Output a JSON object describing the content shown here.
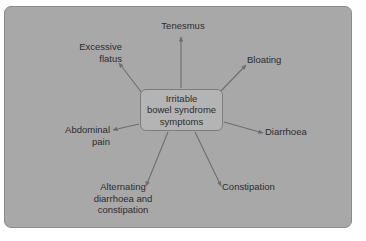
{
  "figure": {
    "type": "radial-concept-diagram",
    "panel_background_color": "#a8a8a8",
    "panel_border_color": "#8b8b8b",
    "page_background_color": "#ffffff",
    "text_color": "#2c2c2c",
    "arrow_color": "#6e6e6e",
    "center": {
      "label": "Irritable\nbowel syndrome\nsymptoms",
      "fill_color": "#b4b4b4",
      "border_color": "#7d7d7d"
    },
    "nodes": [
      {
        "id": "tenesmus",
        "label": "Tenesmus"
      },
      {
        "id": "bloating",
        "label": "Bloating"
      },
      {
        "id": "diarrhoea",
        "label": "Diarrhoea"
      },
      {
        "id": "constipation",
        "label": "Constipation"
      },
      {
        "id": "alternating",
        "label": "Alternating\ndiarrhoea and\nconstipation"
      },
      {
        "id": "abdominal",
        "label": "Abdominal\npain"
      },
      {
        "id": "flatus",
        "label": "Excessive\nflatus"
      }
    ]
  }
}
